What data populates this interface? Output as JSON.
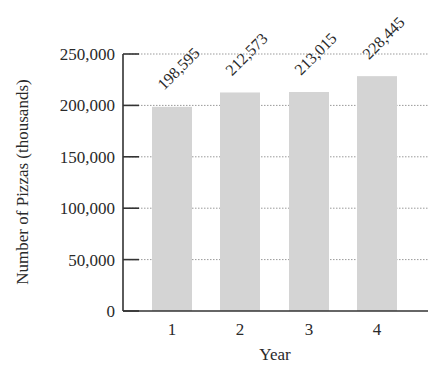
{
  "chart_data": {
    "type": "bar",
    "title": "",
    "xlabel": "Year",
    "ylabel": "Number of Pizzas (thousands)",
    "categories": [
      "1",
      "2",
      "3",
      "4"
    ],
    "values": [
      198595,
      212573,
      213015,
      228445
    ],
    "value_labels": [
      "198,595",
      "212,573",
      "213,015",
      "228,445"
    ],
    "ylim": [
      0,
      250000
    ],
    "yticks": [
      0,
      50000,
      100000,
      150000,
      200000,
      250000
    ],
    "ytick_labels": [
      "0",
      "50,000",
      "100,000",
      "150,000",
      "200,000",
      "250,000"
    ],
    "grid": "horizontal dotted",
    "legend": null,
    "bar_color": "#d4d4d4"
  }
}
